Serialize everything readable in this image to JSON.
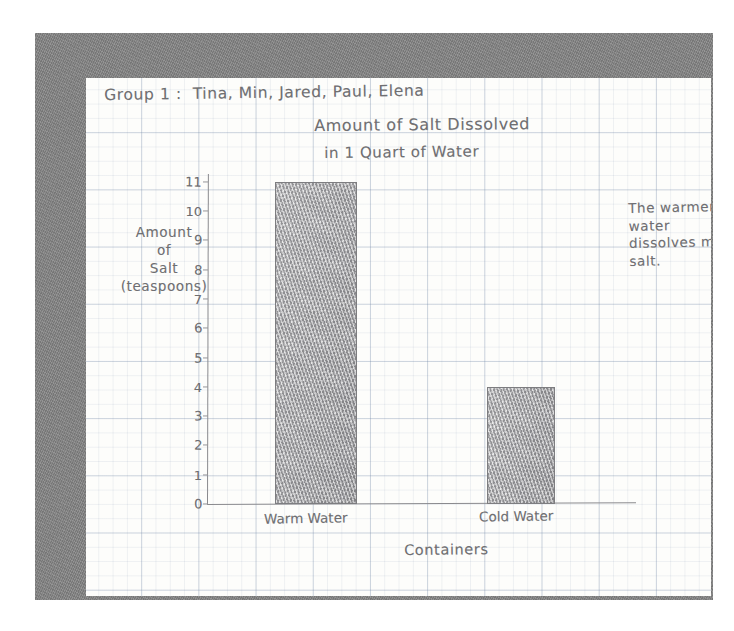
{
  "header": {
    "group_line": "Group 1 :  Tina, Min, Jared, Paul, Elena"
  },
  "chart_data": {
    "type": "bar",
    "title": "Amount of Salt Dissolved",
    "title_line1": "Amount of Salt Dissolved",
    "title_line2": "in 1 Quart of Water",
    "subtitle": "in 1 Quart of Water",
    "categories": [
      "Warm Water",
      "Cold Water"
    ],
    "values": [
      11,
      4
    ],
    "xlabel": "Containers",
    "ylabel": "Amount of Salt (teaspoons)",
    "ylabel_lines": [
      "Amount",
      "of",
      "Salt",
      "(teaspoons)"
    ],
    "ylim": [
      0,
      11
    ],
    "ytick_labels": [
      "0",
      "1",
      "2",
      "3",
      "4",
      "5",
      "6",
      "7",
      "8",
      "9",
      "10",
      "11"
    ],
    "grid": true,
    "legend": "none",
    "annotations": [
      {
        "text": "The warmer water dissolves more salt.",
        "position": "right"
      }
    ],
    "bar_color": "#adadae",
    "ink_color": "#6f6f72"
  },
  "annotation": {
    "note_text": "The warmer water dissolves more salt."
  },
  "colors": {
    "frame": "#818181",
    "paper": "#fdfdfb",
    "ink": "#6f6f72",
    "bar_fill": "#adadae",
    "grid": "#8296aa"
  }
}
